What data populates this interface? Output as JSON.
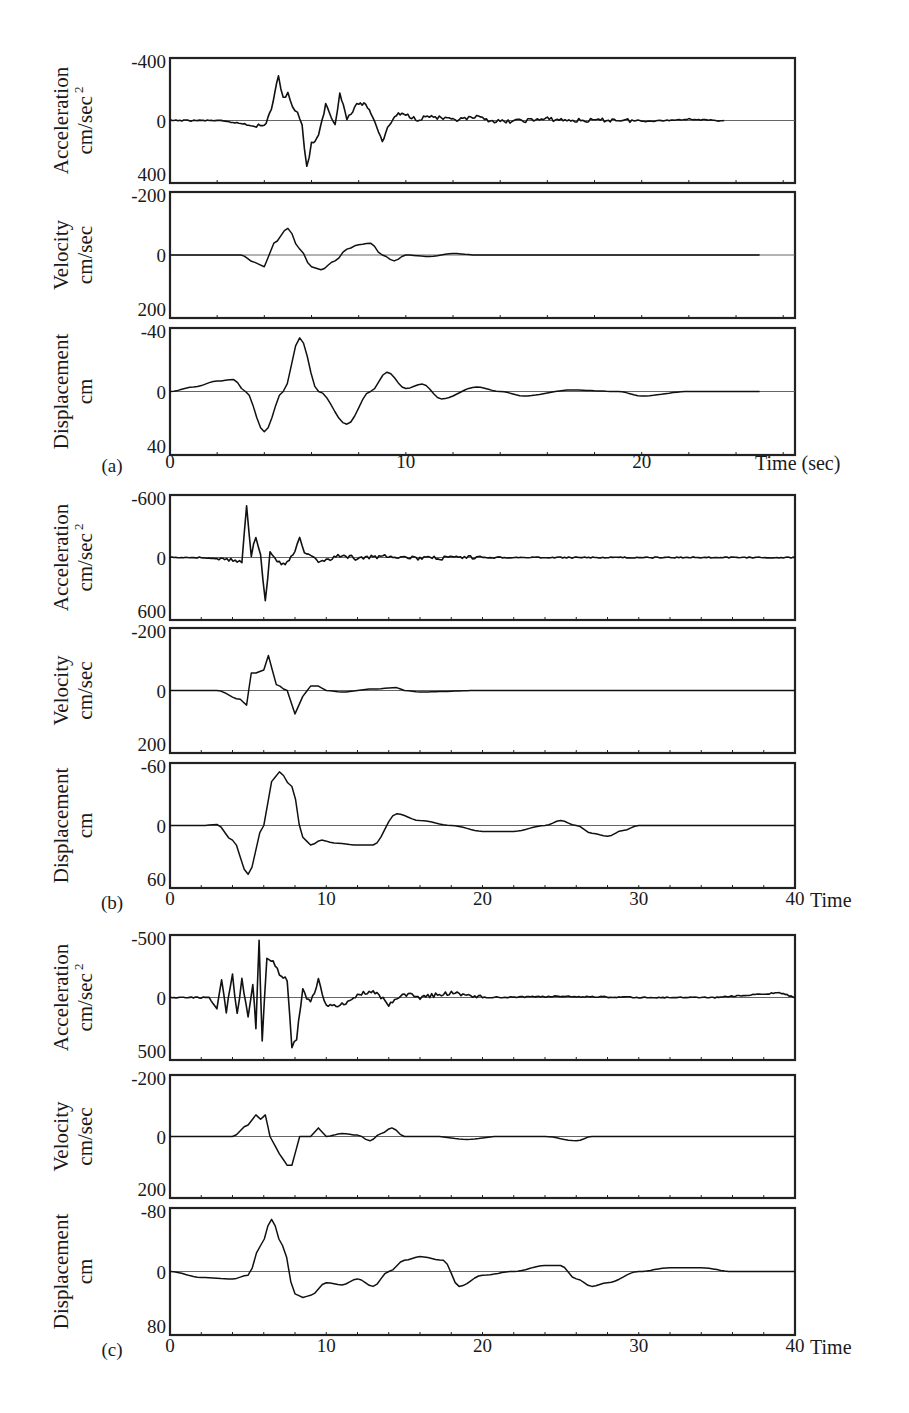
{
  "figure": {
    "groups": [
      {
        "id": "a",
        "label": "(a)",
        "x_axis": {
          "label": "Time (sec)",
          "ticks": [
            "0",
            "10",
            "20"
          ],
          "max": 25
        },
        "panels": [
          {
            "quantity": "Acceleration",
            "unit": "cm/sec",
            "unit_sup": "2",
            "ticks": {
              "top": "-400",
              "mid": "0",
              "bottom": "400"
            }
          },
          {
            "quantity": "Velocity",
            "unit": "cm/sec",
            "unit_sup": "",
            "ticks": {
              "top": "-200",
              "mid": "0",
              "bottom": "200"
            }
          },
          {
            "quantity": "Displacement",
            "unit": "cm",
            "unit_sup": "",
            "ticks": {
              "top": "-40",
              "mid": "0",
              "bottom": "40"
            }
          }
        ]
      },
      {
        "id": "b",
        "label": "(b)",
        "x_axis": {
          "label": "Time",
          "ticks": [
            "0",
            "10",
            "20",
            "30",
            "40"
          ],
          "max": 40
        },
        "panels": [
          {
            "quantity": "Acceleration",
            "unit": "cm/sec",
            "unit_sup": "2",
            "ticks": {
              "top": "-600",
              "mid": "0",
              "bottom": "600"
            }
          },
          {
            "quantity": "Velocity",
            "unit": "cm/sec",
            "unit_sup": "",
            "ticks": {
              "top": "-200",
              "mid": "0",
              "bottom": "200"
            }
          },
          {
            "quantity": "Displacement",
            "unit": "cm",
            "unit_sup": "",
            "ticks": {
              "top": "-60",
              "mid": "0",
              "bottom": "60"
            }
          }
        ]
      },
      {
        "id": "c",
        "label": "(c)",
        "x_axis": {
          "label": "Time",
          "ticks": [
            "0",
            "10",
            "20",
            "30",
            "40"
          ],
          "max": 40
        },
        "panels": [
          {
            "quantity": "Acceleration",
            "unit": "cm/sec",
            "unit_sup": "2",
            "ticks": {
              "top": "-500",
              "mid": "0",
              "bottom": "500"
            }
          },
          {
            "quantity": "Velocity",
            "unit": "cm/sec",
            "unit_sup": "",
            "ticks": {
              "top": "-200",
              "mid": "0",
              "bottom": "200"
            }
          },
          {
            "quantity": "Displacement",
            "unit": "cm",
            "unit_sup": "",
            "ticks": {
              "top": "-80",
              "mid": "0",
              "bottom": "80"
            }
          }
        ]
      }
    ]
  },
  "chart_data": [
    {
      "type": "line",
      "group": "(a)",
      "title": "Acceleration",
      "xlabel": "Time (sec)",
      "ylabel": "Acceleration cm/sec^2",
      "ylim": [
        -400,
        400
      ],
      "xlim": [
        0,
        25
      ],
      "y_inverted": true,
      "grid": false,
      "series": [
        {
          "name": "acceleration",
          "x": [
            0,
            2,
            3,
            3.5,
            4,
            4.3,
            4.6,
            4.8,
            5.0,
            5.2,
            5.4,
            5.6,
            5.8,
            6.0,
            6.3,
            6.6,
            7.0,
            7.2,
            7.5,
            8,
            8.3,
            8.6,
            9,
            9.3,
            9.6,
            10,
            10.5,
            11,
            12,
            13,
            14,
            15,
            16,
            17,
            18,
            19,
            20,
            21,
            22,
            23,
            23.5
          ],
          "y": [
            0,
            0,
            20,
            30,
            40,
            -80,
            -300,
            -160,
            -180,
            -100,
            -60,
            40,
            320,
            160,
            110,
            -110,
            30,
            -200,
            -10,
            -120,
            -110,
            -30,
            140,
            30,
            -40,
            -40,
            -10,
            -30,
            0,
            -20,
            10,
            0,
            -10,
            0,
            0,
            -5,
            5,
            0,
            -10,
            0,
            0
          ]
        }
      ]
    },
    {
      "type": "line",
      "group": "(a)",
      "title": "Velocity",
      "xlabel": "Time (sec)",
      "ylabel": "Velocity cm/sec",
      "ylim": [
        -200,
        200
      ],
      "xlim": [
        0,
        25
      ],
      "y_inverted": true,
      "series": [
        {
          "name": "velocity",
          "x": [
            0,
            2,
            3,
            3.6,
            4.0,
            4.4,
            5.0,
            5.5,
            6.0,
            6.4,
            7,
            7.5,
            8,
            8.5,
            9,
            9.5,
            10,
            11,
            12,
            13,
            15,
            20,
            25
          ],
          "y": [
            0,
            0,
            0,
            25,
            40,
            -40,
            -90,
            -20,
            40,
            50,
            20,
            -20,
            -35,
            -40,
            0,
            20,
            0,
            5,
            -5,
            0,
            0,
            0,
            0
          ]
        }
      ]
    },
    {
      "type": "line",
      "group": "(a)",
      "title": "Displacement",
      "xlabel": "Time (sec)",
      "ylabel": "Displacement cm",
      "ylim": [
        -40,
        40
      ],
      "xlim": [
        0,
        25
      ],
      "y_inverted": true,
      "series": [
        {
          "name": "displacement",
          "x": [
            0,
            1,
            2,
            2.7,
            3.2,
            4.0,
            4.8,
            5.5,
            6.3,
            7.5,
            8.5,
            9.2,
            10,
            10.7,
            11.5,
            13,
            14,
            15,
            17,
            19,
            20,
            22,
            25
          ],
          "y": [
            0,
            -3,
            -7,
            -8,
            0,
            27,
            0,
            -36,
            0,
            22,
            0,
            -13,
            -2,
            -5,
            5,
            -3,
            0,
            3,
            -1,
            0,
            3,
            0,
            0
          ]
        }
      ]
    },
    {
      "type": "line",
      "group": "(b)",
      "title": "Acceleration",
      "xlabel": "Time",
      "ylabel": "Acceleration cm/sec^2",
      "ylim": [
        -600,
        600
      ],
      "xlim": [
        0,
        40
      ],
      "y_inverted": true,
      "series": [
        {
          "name": "acceleration",
          "x": [
            0,
            2,
            3.5,
            4.3,
            4.6,
            4.9,
            5.2,
            5.5,
            5.8,
            6.1,
            6.4,
            6.7,
            7,
            7.5,
            8,
            8.3,
            8.6,
            9,
            9.5,
            10,
            11,
            12,
            14,
            16,
            20,
            25,
            30,
            35,
            40
          ],
          "y": [
            0,
            0,
            20,
            30,
            50,
            -520,
            -20,
            -220,
            -10,
            450,
            -40,
            0,
            60,
            60,
            -60,
            -220,
            -30,
            -20,
            60,
            20,
            -20,
            10,
            -20,
            10,
            0,
            0,
            0,
            0,
            0
          ]
        }
      ]
    },
    {
      "type": "line",
      "group": "(b)",
      "title": "Velocity",
      "xlabel": "Time",
      "ylabel": "Velocity cm/sec",
      "ylim": [
        -200,
        200
      ],
      "xlim": [
        0,
        40
      ],
      "y_inverted": true,
      "series": [
        {
          "name": "velocity",
          "x": [
            0,
            3,
            4.5,
            4.9,
            5.2,
            5.5,
            6,
            6.3,
            6.8,
            7.5,
            8,
            8.5,
            9,
            9.5,
            10,
            11,
            13,
            14.5,
            15,
            16,
            20,
            25,
            30,
            40
          ],
          "y": [
            0,
            0,
            30,
            50,
            -60,
            -60,
            -70,
            -120,
            -20,
            0,
            80,
            20,
            -15,
            -15,
            0,
            5,
            -5,
            -10,
            0,
            5,
            0,
            0,
            0,
            0
          ]
        }
      ]
    },
    {
      "type": "line",
      "group": "(b)",
      "title": "Displacement",
      "xlabel": "Time",
      "ylabel": "Displacement cm",
      "ylim": [
        -60,
        60
      ],
      "xlim": [
        0,
        40
      ],
      "y_inverted": true,
      "series": [
        {
          "name": "displacement",
          "x": [
            0,
            2,
            3,
            4,
            5,
            6,
            6.5,
            7,
            7.8,
            8.5,
            9,
            9.7,
            10.5,
            12,
            13,
            14.5,
            16,
            18,
            20,
            22,
            24,
            25,
            26,
            27,
            28,
            29,
            30,
            35,
            40
          ],
          "y": [
            0,
            0,
            -1,
            15,
            50,
            0,
            -45,
            -55,
            -40,
            12,
            20,
            15,
            18,
            20,
            20,
            -12,
            -5,
            0,
            6,
            6,
            0,
            -5,
            0,
            8,
            11,
            5,
            0,
            0,
            0
          ]
        }
      ]
    },
    {
      "type": "line",
      "group": "(c)",
      "title": "Acceleration",
      "xlabel": "Time",
      "ylabel": "Acceleration cm/sec^2",
      "ylim": [
        -500,
        500
      ],
      "xlim": [
        0,
        40
      ],
      "y_inverted": true,
      "series": [
        {
          "name": "acceleration",
          "x": [
            0,
            2.5,
            3,
            3.3,
            3.6,
            4,
            4.3,
            4.6,
            5,
            5.3,
            5.5,
            5.7,
            5.9,
            6.2,
            6.6,
            7,
            7.5,
            7.8,
            8.1,
            8.5,
            9,
            9.5,
            10,
            11,
            12,
            13,
            14,
            15,
            16,
            18,
            20,
            25,
            30,
            35,
            39,
            40
          ],
          "y": [
            0,
            0,
            100,
            -150,
            120,
            -200,
            150,
            -150,
            180,
            -120,
            250,
            -480,
            380,
            -350,
            -300,
            -200,
            -150,
            420,
            350,
            -60,
            50,
            -150,
            80,
            60,
            -20,
            -60,
            60,
            -30,
            0,
            -40,
            0,
            -10,
            0,
            0,
            -40,
            0
          ]
        }
      ]
    },
    {
      "type": "line",
      "group": "(c)",
      "title": "Velocity",
      "xlabel": "Time",
      "ylabel": "Velocity cm/sec",
      "ylim": [
        -200,
        200
      ],
      "xlim": [
        0,
        40
      ],
      "y_inverted": true,
      "series": [
        {
          "name": "velocity",
          "x": [
            0,
            4,
            5,
            5.5,
            5.8,
            6.1,
            6.4,
            7,
            7.5,
            7.8,
            8.3,
            9,
            9.5,
            10,
            11,
            12,
            12.8,
            13.5,
            14.2,
            15,
            17,
            19,
            21,
            24,
            26,
            27,
            30,
            40
          ],
          "y": [
            0,
            0,
            -40,
            -75,
            -60,
            -75,
            0,
            60,
            100,
            100,
            0,
            0,
            -30,
            0,
            -10,
            -5,
            15,
            -10,
            -30,
            0,
            0,
            10,
            0,
            0,
            15,
            0,
            0,
            0
          ]
        }
      ]
    },
    {
      "type": "line",
      "group": "(c)",
      "title": "Displacement",
      "xlabel": "Time",
      "ylabel": "Displacement cm",
      "ylim": [
        -80,
        80
      ],
      "xlim": [
        0,
        40
      ],
      "y_inverted": true,
      "series": [
        {
          "name": "displacement",
          "x": [
            0,
            2,
            4,
            5,
            5.8,
            6.5,
            7.2,
            8,
            8.5,
            9,
            10,
            11,
            12,
            13,
            14,
            15,
            16,
            17.5,
            18.5,
            20,
            22,
            24,
            25,
            26,
            27,
            28,
            30,
            32,
            34,
            36,
            40
          ],
          "y": [
            0,
            8,
            10,
            5,
            -35,
            -70,
            -35,
            30,
            35,
            32,
            15,
            18,
            10,
            20,
            0,
            -15,
            -20,
            -15,
            20,
            5,
            0,
            -8,
            -8,
            10,
            20,
            15,
            0,
            -5,
            -5,
            0,
            0
          ]
        }
      ]
    }
  ]
}
